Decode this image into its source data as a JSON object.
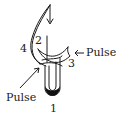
{
  "diagram": {
    "labels": {
      "one": "1",
      "two": "2",
      "three": "3",
      "four": "4",
      "pulse_right": "Pulse",
      "pulse_left": "Pulse"
    },
    "colors": {
      "stroke": "#1a1a1a",
      "background": "#ffffff"
    }
  }
}
